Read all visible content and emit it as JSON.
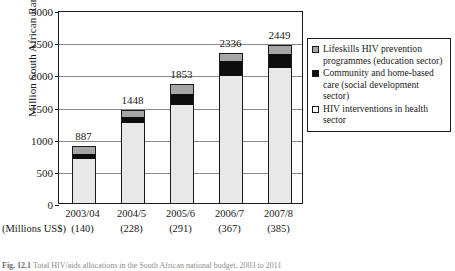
{
  "chart_data": {
    "type": "bar",
    "subtype": "stacked-bar",
    "title": "",
    "xlabel": "",
    "ylabel": "Million South African Rand",
    "ylim": [
      0,
      3000
    ],
    "ytick_step": 500,
    "yticks": [
      0,
      500,
      1000,
      1500,
      2000,
      2500,
      3000
    ],
    "grid": true,
    "legend_position": "right",
    "categories": [
      "2003/04",
      "2004/5",
      "2005/6",
      "2006/7",
      "2007/8"
    ],
    "secondary_axis_caption": "(Millions US$)",
    "secondary_axis_values": [
      "(140)",
      "(228)",
      "(291)",
      "(367)",
      "(385)"
    ],
    "totals": [
      887,
      1448,
      1853,
      2336,
      2449
    ],
    "total_labels": [
      "887",
      "1448",
      "1853",
      "2336",
      "2449"
    ],
    "series": [
      {
        "name": "HIV interventions in health sector",
        "color": "#e8e8e8",
        "values": [
          680,
          1247,
          1524,
          1976,
          2096
        ]
      },
      {
        "name": "Community and home-based care (social development sector)",
        "color": "#0d0d0d",
        "values": [
          80,
          86,
          175,
          228,
          227
        ]
      },
      {
        "name": "Lifeskills HIV prevention programmes (education sector)",
        "color": "#a6a6a6",
        "values": [
          127,
          115,
          154,
          132,
          126
        ]
      }
    ],
    "legend_entries": [
      {
        "label": "Lifeskills HIV prevention programmes (education sector)",
        "swatch": "#a6a6a6"
      },
      {
        "label": "Community and home-based care (social development sector)",
        "swatch": "#0d0d0d"
      },
      {
        "label": "HIV interventions in health sector",
        "swatch": "#ffffff"
      }
    ]
  },
  "caption": {
    "number": "Fig. 12.1",
    "text": "Total HIV/aids allocations in the South African national budget, 2003 to 2011"
  }
}
